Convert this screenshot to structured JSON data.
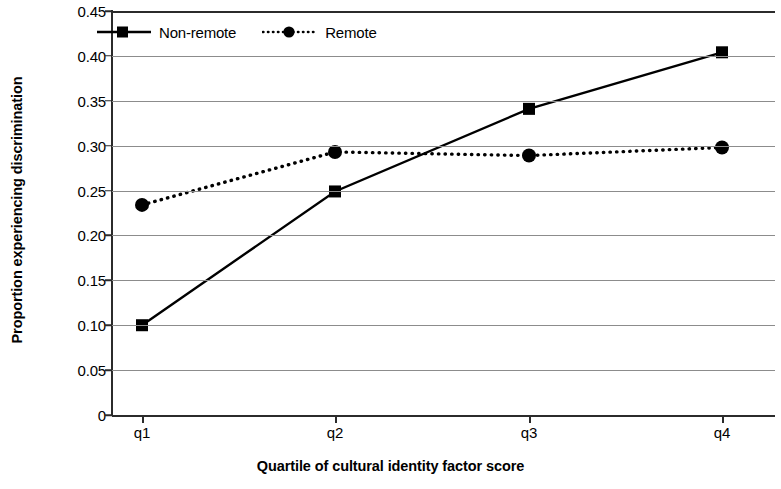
{
  "chart_data": {
    "type": "line",
    "title": "",
    "subtitle": "",
    "xlabel": "Quartile of cultural identity factor score",
    "ylabel": "Proportion experiencing discrimination",
    "categories": [
      "q1",
      "q2",
      "q3",
      "q4"
    ],
    "series": [
      {
        "name": "Non-remote",
        "values": [
          0.1,
          0.249,
          0.341,
          0.404
        ],
        "marker": "square",
        "line_style": "solid",
        "color": "#000000"
      },
      {
        "name": "Remote",
        "values": [
          0.234,
          0.293,
          0.289,
          0.298
        ],
        "marker": "circle",
        "line_style": "dotted",
        "color": "#000000"
      }
    ],
    "ylim": [
      0,
      0.45
    ],
    "ytick_values": [
      0,
      0.05,
      0.1,
      0.15,
      0.2,
      0.25,
      0.3,
      0.35,
      0.4,
      0.45
    ],
    "ytick_labels": [
      "0",
      "0.05",
      "0.10",
      "0.15",
      "0.20",
      "0.25",
      "0.30",
      "0.35",
      "0.40",
      "0.45"
    ],
    "xtick_labels": [
      "q1",
      "q2",
      "q3",
      "q4"
    ],
    "grid": "horizontal",
    "legend_position": "top-left-inside",
    "background_color": "#ffffff"
  },
  "legend": {
    "items": [
      {
        "label": "Non-remote"
      },
      {
        "label": "Remote"
      }
    ]
  }
}
